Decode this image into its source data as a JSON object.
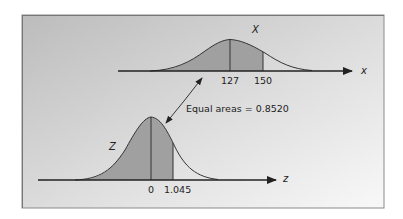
{
  "diagram": {
    "panel": {
      "gradient_start": "#bdbdbd",
      "gradient_end": "#f7f7f7",
      "border": "#8a8a8a"
    },
    "colors": {
      "shade": "#9e9e9e",
      "curve": "#333333",
      "axis": "#222222"
    },
    "top_distribution": {
      "name": "X",
      "axis_label": "x",
      "mean_label": "127",
      "bound_label": "150"
    },
    "bottom_distribution": {
      "name": "Z",
      "axis_label": "z",
      "mean_label": "0",
      "bound_label": "1.045"
    },
    "annotation": {
      "text": "Equal areas = 0.8520"
    }
  }
}
